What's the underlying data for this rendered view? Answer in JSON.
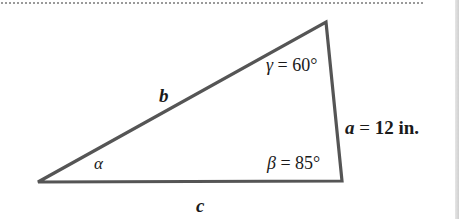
{
  "figure": {
    "type": "triangle",
    "vertices": {
      "bottom_left": [
        38,
        182
      ],
      "top": [
        326,
        22
      ],
      "bottom_right": [
        342,
        181
      ]
    },
    "stroke_color": "#555555",
    "sides": {
      "a": {
        "name": "a",
        "eq": " = ",
        "value": "12 in."
      },
      "b": {
        "name": "b"
      },
      "c": {
        "name": "c"
      }
    },
    "angles": {
      "alpha": {
        "symbol": "α"
      },
      "beta": {
        "symbol": "β",
        "text": " = 85°"
      },
      "gamma": {
        "symbol": "γ",
        "text": " = 60°"
      }
    }
  }
}
